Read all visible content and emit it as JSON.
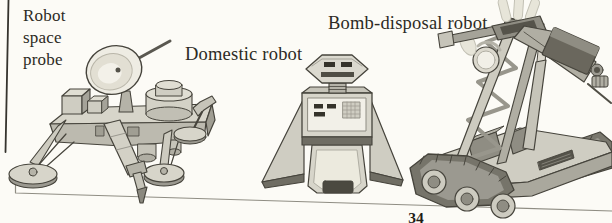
{
  "page": {
    "page_number": "34",
    "background_color": "#fcfbf6",
    "text_color": "#2c2a24",
    "rule_color": "#8f8d83"
  },
  "labels": {
    "space_probe": {
      "text": "Robot space probe",
      "lines": [
        "Robot",
        "space",
        "probe"
      ]
    },
    "domestic": {
      "text": "Domestic robot"
    },
    "bomb_disposal": {
      "text": "Bomb-disposal robot"
    }
  },
  "palette": {
    "outline": "#46443c",
    "fill_light": "#d7d5ca",
    "fill_mid": "#b0aea3",
    "fill_dark": "#6f6d63",
    "dish_highlight": "#f3f1e9",
    "panel_white": "#f2f0e8"
  }
}
